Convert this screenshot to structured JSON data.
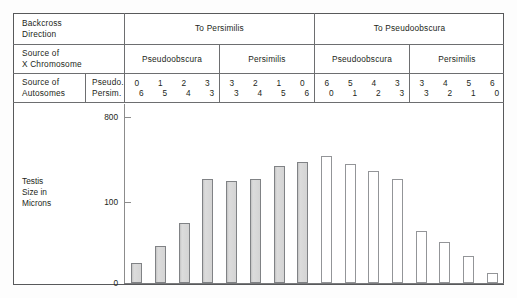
{
  "figure": {
    "row_labels": {
      "backcross": "Backcross\nDirection",
      "backcross_l1": "Backcross",
      "backcross_l2": "Direction",
      "xchrom_l1": "Source of",
      "xchrom_l2": "X Chromosome",
      "autosomes_l1": "Source of",
      "autosomes_l2": "Autosomes",
      "autosome_key_l1": "Pseudo.",
      "autosome_key_l2": "Persim."
    },
    "backcross_directions": [
      {
        "label": "To Persimilis"
      },
      {
        "label": "To Pseudoobscura"
      }
    ],
    "x_chromosome_sources": [
      {
        "label": "Pseudoobscura"
      },
      {
        "label": "Persimilis"
      },
      {
        "label": "Pseudoobscura"
      },
      {
        "label": "Persimilis"
      }
    ],
    "autosome_groups": [
      {
        "pseudoobscura": [
          "0",
          "1",
          "2",
          "3"
        ],
        "persimilis": [
          "6",
          "5",
          "4",
          "3"
        ]
      },
      {
        "pseudoobscura": [
          "3",
          "2",
          "1",
          "0"
        ],
        "persimilis": [
          "3",
          "4",
          "5",
          "6"
        ]
      },
      {
        "pseudoobscura": [
          "6",
          "5",
          "4",
          "3"
        ],
        "persimilis": [
          "0",
          "1",
          "2",
          "3"
        ]
      },
      {
        "pseudoobscura": [
          "3",
          "4",
          "5",
          "6"
        ],
        "persimilis": [
          "3",
          "2",
          "1",
          "0"
        ]
      }
    ],
    "y_axis": {
      "label_l1": "Testis",
      "label_l2": "Size in",
      "label_l3": "Microns",
      "ticks": [
        "800",
        "100",
        "0"
      ]
    },
    "colors": {
      "frame": "#58595b",
      "rule": "#6d6e70",
      "bar_filled": "#d2d2d2",
      "bar_filled_edge": "#808285",
      "bar_open": "#ffffff",
      "bar_open_edge": "#939598",
      "text": "#231f20"
    }
  },
  "chart_data": {
    "type": "bar",
    "title": "",
    "xlabel": "",
    "ylabel": "Testis Size in Microns",
    "ylim": [
      0,
      860
    ],
    "grid": false,
    "legend_position": "none",
    "y_tick_values": [
      0,
      100,
      800
    ],
    "axis_note": "y-axis ticks shown at 0, 100 and 800 microns",
    "categories": [
      "To Persimilis / Pseudoobscura X / 0-6",
      "To Persimilis / Pseudoobscura X / 1-5",
      "To Persimilis / Pseudoobscura X / 2-4",
      "To Persimilis / Pseudoobscura X / 3-3",
      "To Persimilis / Persimilis X / 3-3",
      "To Persimilis / Persimilis X / 2-4",
      "To Persimilis / Persimilis X / 1-5",
      "To Persimilis / Persimilis X / 0-6",
      "To Pseudoobscura / Pseudoobscura X / 6-0",
      "To Pseudoobscura / Pseudoobscura X / 5-1",
      "To Pseudoobscura / Pseudoobscura X / 4-2",
      "To Pseudoobscura / Pseudoobscura X / 3-3",
      "To Pseudoobscura / Persimilis X / 3-3",
      "To Pseudoobscura / Persimilis X / 4-2",
      "To Pseudoobscura / Persimilis X / 5-1",
      "To Pseudoobscura / Persimilis X / 6-0"
    ],
    "values": [
      95,
      180,
      290,
      500,
      490,
      500,
      560,
      580,
      610,
      570,
      540,
      500,
      250,
      195,
      130,
      50
    ],
    "bar_styles": [
      "filled",
      "filled",
      "filled",
      "filled",
      "filled",
      "filled",
      "filled",
      "filled",
      "open",
      "open",
      "open",
      "open",
      "open",
      "open",
      "open",
      "open"
    ]
  }
}
